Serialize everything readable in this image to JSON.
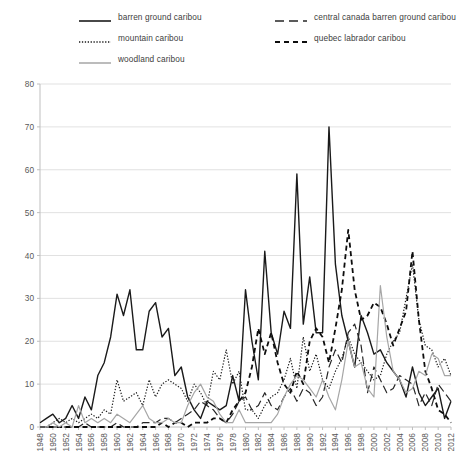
{
  "chart_data": {
    "type": "line",
    "title": "",
    "subtitle": "",
    "xlabel": "",
    "ylabel": "",
    "xlim": [
      1948,
      2012
    ],
    "ylim": [
      0,
      80
    ],
    "yticks": [
      0,
      10,
      20,
      30,
      40,
      50,
      60,
      70,
      80
    ],
    "xticks": [
      1948,
      1950,
      1952,
      1954,
      1956,
      1958,
      1960,
      1962,
      1964,
      1966,
      1968,
      1970,
      1972,
      1974,
      1976,
      1978,
      1980,
      1982,
      1984,
      1986,
      1988,
      1990,
      1992,
      1994,
      1996,
      1998,
      2000,
      2002,
      2004,
      2006,
      2008,
      2010,
      2012
    ],
    "grid": "horizontal",
    "legend_position": "top",
    "x": [
      1948,
      1949,
      1950,
      1951,
      1952,
      1953,
      1954,
      1955,
      1956,
      1957,
      1958,
      1959,
      1960,
      1961,
      1962,
      1963,
      1964,
      1965,
      1966,
      1967,
      1968,
      1969,
      1970,
      1971,
      1972,
      1973,
      1974,
      1975,
      1976,
      1977,
      1978,
      1979,
      1980,
      1981,
      1982,
      1983,
      1984,
      1985,
      1986,
      1987,
      1988,
      1989,
      1990,
      1991,
      1992,
      1993,
      1994,
      1995,
      1996,
      1997,
      1998,
      1999,
      2000,
      2001,
      2002,
      2003,
      2004,
      2005,
      2006,
      2007,
      2008,
      2009,
      2010,
      2011,
      2012
    ],
    "series": [
      {
        "name": "barren ground caribou",
        "style": "solid",
        "color": "#1a1a1a",
        "width": 1.4,
        "values": [
          1,
          2,
          3,
          1,
          2,
          5,
          2,
          7,
          4,
          12,
          15,
          21,
          31,
          26,
          32,
          18,
          18,
          27,
          29,
          21,
          23,
          12,
          14,
          7,
          4,
          2,
          6,
          5,
          4,
          5,
          12,
          6,
          32,
          20,
          11,
          41,
          22,
          17,
          27,
          23,
          59,
          24,
          35,
          22,
          22,
          70,
          38,
          26,
          20,
          14,
          26,
          22,
          17,
          18,
          15,
          13,
          11,
          7,
          14,
          8,
          5,
          7,
          9,
          2,
          6
        ]
      },
      {
        "name": "central canada barren ground caribou",
        "style": "dashed-long",
        "color": "#262626",
        "width": 1.2,
        "values": [
          0,
          0,
          0,
          0,
          0,
          0,
          0,
          1,
          0,
          0,
          0,
          0,
          1,
          0,
          0,
          0,
          1,
          1,
          1,
          2,
          2,
          1,
          2,
          3,
          4,
          6,
          5,
          4,
          2,
          1,
          3,
          6,
          7,
          4,
          5,
          8,
          5,
          4,
          7,
          9,
          6,
          9,
          8,
          5,
          7,
          14,
          18,
          15,
          22,
          24,
          19,
          8,
          14,
          11,
          8,
          9,
          12,
          11,
          10,
          5,
          8,
          5,
          10,
          8,
          6
        ]
      },
      {
        "name": "mountain caribou",
        "style": "dotted",
        "color": "#1a1a1a",
        "width": 1.2,
        "values": [
          0,
          0,
          1,
          2,
          1,
          2,
          1,
          2,
          3,
          2,
          4,
          3,
          11,
          6,
          7,
          8,
          5,
          11,
          7,
          10,
          11,
          10,
          9,
          6,
          10,
          8,
          5,
          13,
          11,
          18,
          10,
          13,
          4,
          4,
          2,
          5,
          7,
          8,
          11,
          16,
          9,
          21,
          13,
          17,
          11,
          9,
          13,
          16,
          21,
          17,
          15,
          13,
          11,
          12,
          17,
          20,
          22,
          30,
          38,
          25,
          19,
          18,
          14,
          16,
          12
        ]
      },
      {
        "name": "quebec labrador caribou",
        "style": "dashed-short",
        "color": "#0d0d0d",
        "width": 1.8,
        "values": [
          0,
          0,
          0,
          0,
          0,
          0,
          0,
          0,
          0,
          0,
          0,
          0,
          0,
          0,
          0,
          0,
          0,
          0,
          0,
          1,
          0,
          1,
          1,
          0,
          1,
          1,
          1,
          2,
          2,
          1,
          4,
          6,
          8,
          14,
          23,
          17,
          22,
          15,
          10,
          8,
          13,
          10,
          20,
          23,
          21,
          15,
          23,
          32,
          46,
          32,
          25,
          26,
          29,
          28,
          24,
          19,
          23,
          27,
          41,
          25,
          13,
          9,
          4,
          3,
          1
        ]
      },
      {
        "name": "woodland caribou",
        "style": "solid",
        "color": "#a6a6a6",
        "width": 1.2,
        "values": [
          0,
          0,
          1,
          0,
          1,
          0,
          5,
          1,
          2,
          1,
          2,
          1,
          3,
          2,
          1,
          3,
          5,
          2,
          1,
          1,
          2,
          1,
          1,
          5,
          8,
          10,
          7,
          6,
          3,
          1,
          1,
          4,
          1,
          1,
          1,
          1,
          1,
          3,
          7,
          10,
          12,
          11,
          9,
          7,
          11,
          7,
          4,
          11,
          20,
          14,
          15,
          9,
          7,
          33,
          21,
          13,
          11,
          8,
          9,
          13,
          12,
          17,
          16,
          12,
          12
        ]
      }
    ]
  },
  "legend": {
    "items": [
      {
        "label": "barren ground caribou"
      },
      {
        "label": "mountain caribou"
      },
      {
        "label": "woodland caribou"
      },
      {
        "label": "central canada barren ground caribou"
      },
      {
        "label": "quebec labrador caribou"
      }
    ]
  }
}
